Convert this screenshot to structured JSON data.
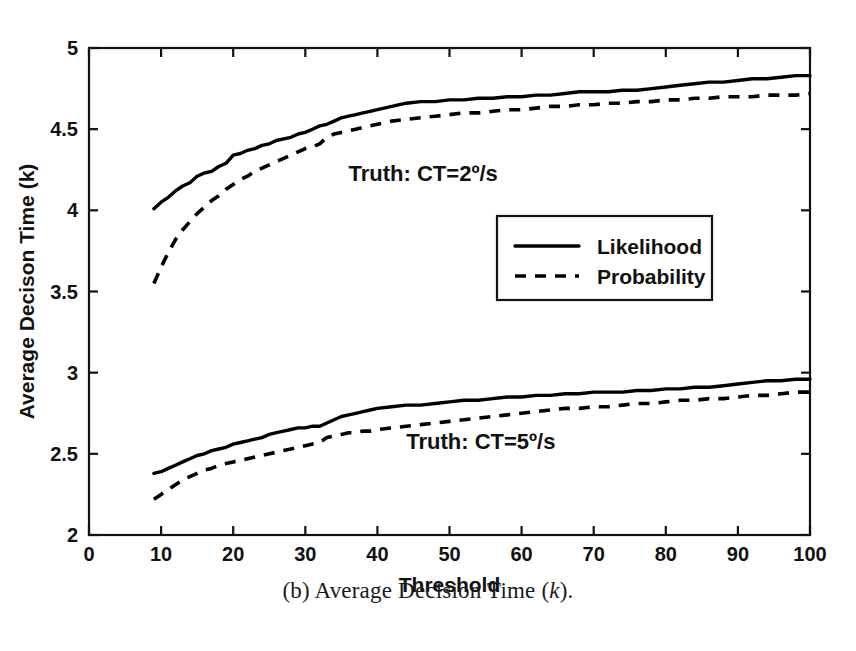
{
  "figure": {
    "caption_prefix": "(b) Average Decision Time (",
    "caption_italic": "k",
    "caption_suffix": ")."
  },
  "chart_data": {
    "type": "line",
    "title": "",
    "xlabel": "Threshold",
    "ylabel": "Average Decison Time (k)",
    "xlim": [
      0,
      100
    ],
    "ylim": [
      2,
      5
    ],
    "xticks": [
      0,
      10,
      20,
      30,
      40,
      50,
      60,
      70,
      80,
      90,
      100
    ],
    "xticklabels": [
      "0",
      "10",
      "20",
      "30",
      "40",
      "50",
      "60",
      "70",
      "80",
      "90",
      "100"
    ],
    "yticks": [
      2,
      2.5,
      3,
      3.5,
      4,
      4.5,
      5
    ],
    "yticklabels": [
      "2",
      "2.5",
      "3",
      "3.5",
      "4",
      "4.5",
      "5"
    ],
    "grid": false,
    "legend_position": "center-right",
    "legend": [
      "Likelihood",
      "Probability"
    ],
    "annotations": [
      {
        "text": "Truth: CT=2º/s",
        "x": 36,
        "y": 4.18
      },
      {
        "text": "Truth: CT=5º/s",
        "x": 44,
        "y": 2.53
      }
    ],
    "x": [
      9,
      10,
      11,
      12,
      13,
      14,
      15,
      16,
      17,
      18,
      19,
      20,
      21,
      22,
      23,
      24,
      25,
      26,
      27,
      28,
      29,
      30,
      31,
      32,
      33,
      34,
      35,
      36,
      37,
      38,
      39,
      40,
      42,
      44,
      46,
      48,
      50,
      52,
      54,
      56,
      58,
      60,
      62,
      64,
      66,
      68,
      70,
      72,
      74,
      76,
      78,
      80,
      82,
      84,
      86,
      88,
      90,
      92,
      94,
      96,
      98,
      100
    ],
    "series": [
      {
        "name": "Likelihood",
        "group": "Truth: CT=2º/s",
        "style": "solid",
        "values": [
          4.01,
          4.05,
          4.08,
          4.12,
          4.15,
          4.17,
          4.21,
          4.23,
          4.24,
          4.27,
          4.29,
          4.34,
          4.35,
          4.37,
          4.38,
          4.4,
          4.41,
          4.43,
          4.44,
          4.45,
          4.47,
          4.48,
          4.5,
          4.52,
          4.53,
          4.55,
          4.57,
          4.58,
          4.59,
          4.6,
          4.61,
          4.62,
          4.64,
          4.66,
          4.67,
          4.67,
          4.68,
          4.68,
          4.69,
          4.69,
          4.7,
          4.7,
          4.71,
          4.71,
          4.72,
          4.73,
          4.73,
          4.73,
          4.74,
          4.74,
          4.75,
          4.76,
          4.77,
          4.78,
          4.79,
          4.79,
          4.8,
          4.81,
          4.81,
          4.82,
          4.83,
          4.83
        ]
      },
      {
        "name": "Probability",
        "group": "Truth: CT=2º/s",
        "style": "dashed",
        "values": [
          3.55,
          3.65,
          3.74,
          3.82,
          3.88,
          3.93,
          3.98,
          4.02,
          4.06,
          4.09,
          4.13,
          4.16,
          4.19,
          4.21,
          4.24,
          4.26,
          4.28,
          4.3,
          4.32,
          4.34,
          4.36,
          4.38,
          4.39,
          4.41,
          4.45,
          4.47,
          4.48,
          4.49,
          4.5,
          4.51,
          4.52,
          4.53,
          4.55,
          4.56,
          4.57,
          4.58,
          4.59,
          4.6,
          4.6,
          4.61,
          4.62,
          4.62,
          4.63,
          4.64,
          4.64,
          4.65,
          4.65,
          4.66,
          4.66,
          4.67,
          4.67,
          4.68,
          4.68,
          4.69,
          4.69,
          4.7,
          4.7,
          4.7,
          4.71,
          4.71,
          4.71,
          4.72
        ]
      },
      {
        "name": "Likelihood",
        "group": "Truth: CT=5º/s",
        "style": "solid",
        "values": [
          2.38,
          2.39,
          2.41,
          2.43,
          2.45,
          2.47,
          2.49,
          2.5,
          2.52,
          2.53,
          2.54,
          2.56,
          2.57,
          2.58,
          2.59,
          2.6,
          2.62,
          2.63,
          2.64,
          2.65,
          2.66,
          2.66,
          2.67,
          2.67,
          2.69,
          2.71,
          2.73,
          2.74,
          2.75,
          2.76,
          2.77,
          2.78,
          2.79,
          2.8,
          2.8,
          2.81,
          2.82,
          2.83,
          2.83,
          2.84,
          2.85,
          2.85,
          2.86,
          2.86,
          2.87,
          2.87,
          2.88,
          2.88,
          2.88,
          2.89,
          2.89,
          2.9,
          2.9,
          2.91,
          2.91,
          2.92,
          2.93,
          2.94,
          2.95,
          2.95,
          2.96,
          2.96
        ]
      },
      {
        "name": "Probability",
        "group": "Truth: CT=5º/s",
        "style": "dashed",
        "values": [
          2.22,
          2.25,
          2.28,
          2.31,
          2.34,
          2.36,
          2.38,
          2.4,
          2.41,
          2.43,
          2.44,
          2.45,
          2.46,
          2.47,
          2.48,
          2.49,
          2.5,
          2.51,
          2.52,
          2.53,
          2.54,
          2.55,
          2.56,
          2.57,
          2.6,
          2.61,
          2.62,
          2.63,
          2.63,
          2.64,
          2.64,
          2.65,
          2.66,
          2.67,
          2.68,
          2.69,
          2.7,
          2.71,
          2.72,
          2.73,
          2.74,
          2.75,
          2.76,
          2.77,
          2.78,
          2.78,
          2.79,
          2.79,
          2.8,
          2.81,
          2.81,
          2.82,
          2.83,
          2.83,
          2.84,
          2.84,
          2.85,
          2.86,
          2.86,
          2.87,
          2.88,
          2.88
        ]
      }
    ]
  }
}
